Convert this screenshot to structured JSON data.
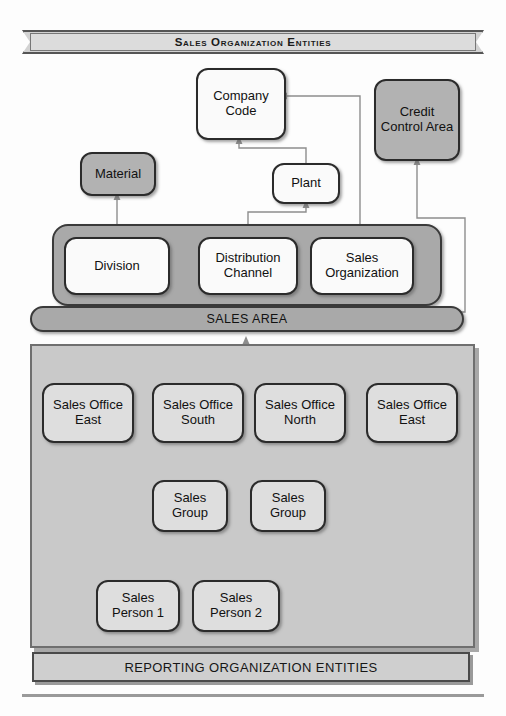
{
  "diagram": {
    "title_banner": "Sales Organization Entities",
    "footer_banner": "REPORTING ORGANIZATION ENTITIES",
    "group_label": "SALES AREA",
    "colors": {
      "gray_fill": "#b2b2b2",
      "light_fill": "#dedede",
      "white_fill": "#fafafa",
      "area_fill": "#a9a9a9",
      "panel_fill": "#c9c9c9",
      "border": "#2b2b2b"
    }
  },
  "nodes": {
    "company_code": "Company\nCode",
    "company_code_line1": "Company",
    "company_code_line2": "Code",
    "credit_control_line1": "Credit",
    "credit_control_line2": "Control Area",
    "material": "Material",
    "plant": "Plant",
    "division": "Division",
    "distribution_channel_line1": "Distribution",
    "distribution_channel_line2": "Channel",
    "sales_organization_line1": "Sales",
    "sales_organization_line2": "Organization"
  },
  "sales_offices": [
    {
      "line1": "Sales Office",
      "line2": "East"
    },
    {
      "line1": "Sales Office",
      "line2": "South"
    },
    {
      "line1": "Sales Office",
      "line2": "North"
    },
    {
      "line1": "Sales Office",
      "line2": "East"
    }
  ],
  "sales_groups": [
    {
      "line1": "Sales",
      "line2": "Group"
    },
    {
      "line1": "Sales",
      "line2": "Group"
    }
  ],
  "sales_persons": [
    {
      "line1": "Sales",
      "line2": "Person 1"
    },
    {
      "line1": "Sales",
      "line2": "Person 2"
    }
  ]
}
